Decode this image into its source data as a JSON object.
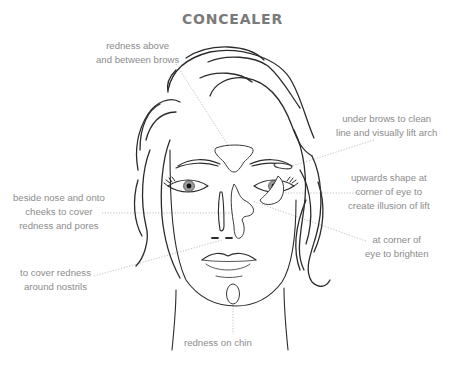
{
  "title": "CONCEALER",
  "colors": {
    "title": "#7a7a7a",
    "label_text": "#8c8c8c",
    "leader_line": "#b8b8b8",
    "drawing_stroke": "#2b2b2b",
    "background": "#ffffff"
  },
  "labels": [
    {
      "id": "brows-between",
      "lines": [
        "redness above",
        "and between brows"
      ]
    },
    {
      "id": "under-brows",
      "lines": [
        "under brows to clean",
        "line and visually lift arch"
      ]
    },
    {
      "id": "eye-corner-upwards",
      "lines": [
        "upwards shape at",
        "corner of eye to",
        "create illusion of lift"
      ]
    },
    {
      "id": "beside-nose",
      "lines": [
        "beside nose and onto",
        "cheeks to cover",
        "redness and pores"
      ]
    },
    {
      "id": "eye-corner-brighten",
      "lines": [
        "at corner of",
        "eye to brighten"
      ]
    },
    {
      "id": "nostrils",
      "lines": [
        "to cover redness",
        "around nostrils"
      ]
    },
    {
      "id": "chin",
      "lines": [
        "redness on chin"
      ]
    }
  ]
}
